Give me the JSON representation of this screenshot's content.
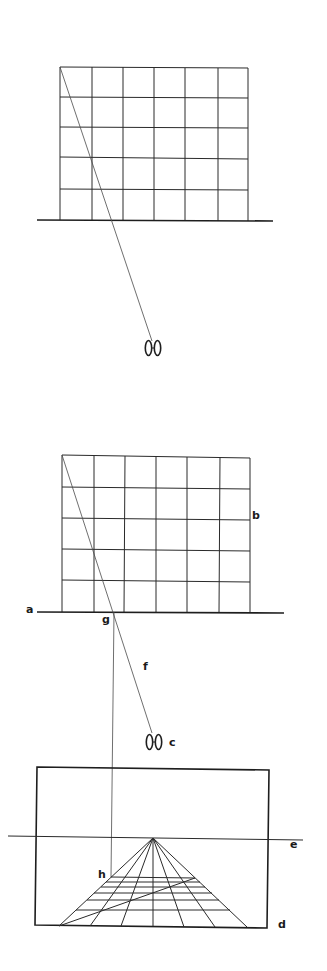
{
  "figure_top": {
    "description": "Grid wall on ground line with sight line to observer (plan view)",
    "grid": {
      "left": 60,
      "right": 248,
      "top": 67,
      "bottom": 220,
      "cols": 6,
      "rows": 5
    },
    "ground_line": {
      "x1": 37,
      "y1": 220,
      "x2": 273,
      "y2": 221
    },
    "sight_line": {
      "x1": 60,
      "y1": 67,
      "x2": 152,
      "y2": 341
    },
    "observer": {
      "x": 153,
      "y": 348,
      "icon": "feet-icon"
    }
  },
  "figure_bottom": {
    "description": "Same grid with picture plane projection into perspective frame",
    "grid": {
      "left": 62,
      "right": 250,
      "top": 455,
      "bottom": 612,
      "cols": 6,
      "rows": 5
    },
    "ground_line": {
      "x1": 37,
      "y1": 612,
      "x2": 284,
      "y2": 613
    },
    "sight_line": {
      "x1": 62,
      "y1": 455,
      "x2": 152,
      "y2": 733
    },
    "projection_line": {
      "x1": 114,
      "y1": 612,
      "x2": 111,
      "y2": 877
    },
    "observer": {
      "x": 154,
      "y": 742,
      "icon": "feet-icon"
    },
    "frame": {
      "left": 36,
      "top": 768,
      "right": 268,
      "bottom": 927
    },
    "horizon_line": {
      "x1": 8,
      "y1": 836,
      "x2": 303,
      "y2": 840
    },
    "vanishing_point": {
      "x": 153,
      "y": 838
    },
    "perspective_grid": {
      "base_y": 926,
      "base_xs": [
        59,
        90,
        121,
        153,
        184,
        215,
        247
      ],
      "row_ys": [
        878,
        882,
        887,
        893,
        900,
        910,
        926
      ],
      "diagonal": {
        "x1": 59,
        "y1": 926,
        "x2": 195,
        "y2": 878
      }
    },
    "labels": {
      "a": "a",
      "b": "b",
      "c": "c",
      "d": "d",
      "e": "e",
      "f": "f",
      "g": "g",
      "h": "h"
    }
  }
}
